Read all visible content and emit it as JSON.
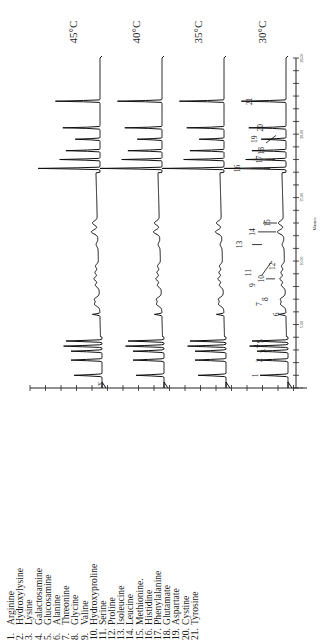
{
  "chart_data": {
    "type": "line",
    "title": "",
    "orientation": "rotated-90-ccw",
    "xlabel": "Minutes",
    "ylabel": "",
    "xlim": [
      0,
      26
    ],
    "x_ticks": [
      "0",
      "5.00",
      "10.00",
      "15.00",
      "20.00",
      "26.00"
    ],
    "series": [
      {
        "name": "45°C",
        "label": "45°C"
      },
      {
        "name": "40°C",
        "label": "40°C"
      },
      {
        "name": "35°C",
        "label": "35°C"
      },
      {
        "name": "30°C",
        "label": "30°C"
      }
    ],
    "peaks": [
      {
        "id": "1",
        "time": 1.0,
        "height": 0.45
      },
      {
        "id": "2",
        "time": 2.2,
        "height": 0.5
      },
      {
        "id": "3",
        "time": 2.9,
        "height": 0.5
      },
      {
        "id": "4",
        "time": 3.3,
        "height": 0.62
      },
      {
        "id": "5",
        "time": 3.7,
        "height": 0.58
      },
      {
        "id": "6",
        "time": 5.8,
        "height": 0.12
      },
      {
        "id": "7",
        "time": 6.6,
        "height": 0.08
      },
      {
        "id": "8",
        "time": 7.0,
        "height": 0.08
      },
      {
        "id": "9",
        "time": 8.1,
        "height": 0.06
      },
      {
        "id": "10",
        "time": 8.6,
        "height": 0.08
      },
      {
        "id": "11",
        "time": 9.1,
        "height": 0.06
      },
      {
        "id": "12",
        "time": 9.6,
        "height": 0.05
      },
      {
        "id": "13",
        "time": 11.3,
        "height": 0.03
      },
      {
        "id": "14",
        "time": 12.3,
        "height": 0.1
      },
      {
        "id": "15",
        "time": 13.0,
        "height": 0.08
      },
      {
        "id": "16",
        "time": 17.3,
        "height": 1.0
      },
      {
        "id": "17",
        "time": 18.0,
        "height": 0.65
      },
      {
        "id": "18",
        "time": 18.7,
        "height": 0.55
      },
      {
        "id": "19",
        "time": 19.6,
        "height": 0.4
      },
      {
        "id": "20",
        "time": 20.5,
        "height": 0.6
      },
      {
        "id": "21",
        "time": 22.6,
        "height": 0.72
      }
    ]
  },
  "legend": {
    "items": [
      {
        "num": "1.",
        "name": "Arginine"
      },
      {
        "num": "2.",
        "name": "Hydroxylysine"
      },
      {
        "num": "3.",
        "name": "Lysine"
      },
      {
        "num": "4.",
        "name": "Galactosamine"
      },
      {
        "num": "5.",
        "name": "Glucosamine"
      },
      {
        "num": "6.",
        "name": "Alanine"
      },
      {
        "num": "7.",
        "name": "Threonine"
      },
      {
        "num": "8.",
        "name": "Glycine"
      },
      {
        "num": "9.",
        "name": "Valine"
      },
      {
        "num": "10.",
        "name": "Hydroxyproline"
      },
      {
        "num": "11.",
        "name": "Serine"
      },
      {
        "num": "12.",
        "name": "Proline"
      },
      {
        "num": "13.",
        "name": "Isoleucine"
      },
      {
        "num": "14.",
        "name": "Leucine"
      },
      {
        "num": "15.",
        "name": "Methionine."
      },
      {
        "num": "16.",
        "name": "Histidine"
      },
      {
        "num": "17.",
        "name": "Phenylalanine"
      },
      {
        "num": "18.",
        "name": "Glutamate"
      },
      {
        "num": "19.",
        "name": "Aspartate"
      },
      {
        "num": "20.",
        "name": "Cystine"
      },
      {
        "num": "21.",
        "name": "Tyrosine"
      }
    ]
  },
  "temps": [
    "45°C",
    "40°C",
    "35°C",
    "30°C"
  ],
  "axis": {
    "unit_label": "Minutes",
    "stray_mark": "v"
  }
}
